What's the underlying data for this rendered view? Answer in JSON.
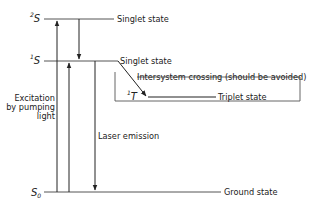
{
  "diagram": {
    "type": "energy-level-diagram",
    "levels": [
      {
        "id": "S2",
        "symbol": "S",
        "superscript": "2",
        "subscript": "",
        "label": "Singlet state"
      },
      {
        "id": "S1",
        "symbol": "S",
        "superscript": "1",
        "subscript": "",
        "label": "Singlet state"
      },
      {
        "id": "T1",
        "symbol": "T",
        "superscript": "1",
        "subscript": "",
        "label": "Triplet state"
      },
      {
        "id": "S0",
        "symbol": "S",
        "superscript": "",
        "subscript": "0",
        "label": "Ground state"
      }
    ],
    "transitions": [
      {
        "from": "S0",
        "to": "S2",
        "direction": "up"
      },
      {
        "from": "S0",
        "to": "S1",
        "direction": "up"
      },
      {
        "from": "S2",
        "to": "S1",
        "direction": "down"
      },
      {
        "from": "S1",
        "to": "S0",
        "direction": "down",
        "label": "Laser emission"
      },
      {
        "from": "S1",
        "to": "T1",
        "direction": "down",
        "label": "Intersystem crossing (should be avoided)"
      }
    ],
    "excitation_label": [
      "Excitation",
      "by pumping",
      "light"
    ],
    "emission_label": "Laser emission",
    "isc_label": "Intersystem crossing (should be avoided)",
    "colors": {
      "line": "#222222",
      "level_line": "#555555",
      "background": "#ffffff"
    }
  }
}
